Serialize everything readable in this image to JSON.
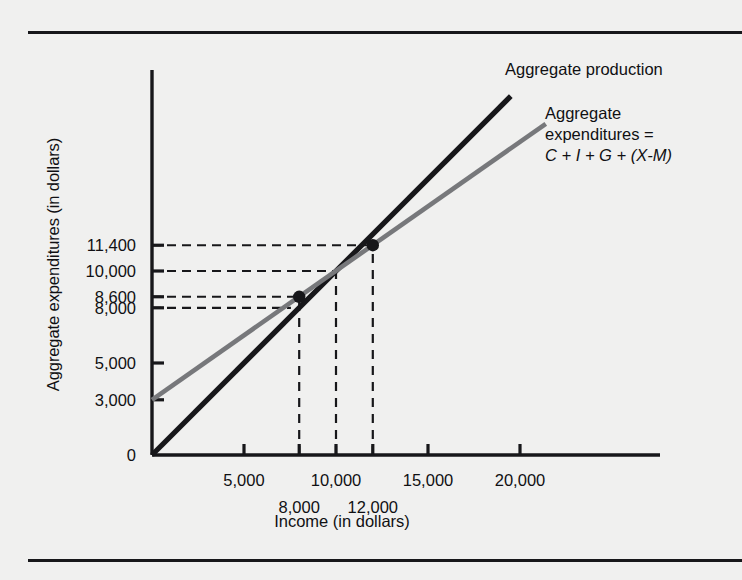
{
  "chart_data": {
    "type": "line",
    "title": "",
    "xlabel": "Income (in dollars)",
    "ylabel": "Aggregate expenditures (in dollars)",
    "xlim": [
      0,
      22500
    ],
    "ylim": [
      0,
      22500
    ],
    "grid": false,
    "legend_position": "right",
    "series": [
      {
        "name": "Aggregate production",
        "color": "#17171a",
        "intercept": 0,
        "slope": 1,
        "x": [
          0,
          19500
        ],
        "values": [
          0,
          19500
        ]
      },
      {
        "name": "Aggregate expenditures = C + I + G + (X-M)",
        "color": "#77787b",
        "intercept": 3000,
        "slope": 0.7,
        "x": [
          0,
          21400
        ],
        "values": [
          3000,
          18000
        ]
      }
    ],
    "xticks": [
      {
        "value": 5000,
        "label": "5,000",
        "row": 1
      },
      {
        "value": 8000,
        "label": "8,000",
        "row": 2
      },
      {
        "value": 10000,
        "label": "10,000",
        "row": 1
      },
      {
        "value": 12000,
        "label": "12,000",
        "row": 2
      },
      {
        "value": 15000,
        "label": "15,000",
        "row": 1
      },
      {
        "value": 20000,
        "label": "20,000",
        "row": 1
      }
    ],
    "yticks": [
      {
        "value": 0,
        "label": "0"
      },
      {
        "value": 3000,
        "label": "3,000"
      },
      {
        "value": 5000,
        "label": "5,000"
      },
      {
        "value": 8000,
        "label": "8,000"
      },
      {
        "value": 8600,
        "label": "8,600"
      },
      {
        "value": 10000,
        "label": "10,000"
      },
      {
        "value": 11400,
        "label": "11,400"
      }
    ],
    "annotations": [
      {
        "name": "point-low",
        "x": 8000,
        "y": 8600,
        "marker": "dot"
      },
      {
        "name": "point-equilibrium",
        "x": 10000,
        "y": 10000,
        "marker": "none"
      },
      {
        "name": "point-high",
        "x": 12000,
        "y": 11400,
        "marker": "dot"
      }
    ],
    "guide_lines": [
      {
        "name": "guide-11400",
        "orientation": "horizontal",
        "y": 11400,
        "x_end": 12000
      },
      {
        "name": "guide-10000",
        "orientation": "horizontal",
        "y": 10000,
        "x_end": 10000
      },
      {
        "name": "guide-8600",
        "orientation": "horizontal",
        "y": 8600,
        "x_end": 8000
      },
      {
        "name": "guide-8000",
        "orientation": "horizontal",
        "y": 8000,
        "x_end": 7550
      },
      {
        "name": "guide-8000-x",
        "orientation": "vertical",
        "x": 8000,
        "y_end": 8600
      },
      {
        "name": "guide-10000-x",
        "orientation": "vertical",
        "x": 10000,
        "y_end": 10000
      },
      {
        "name": "guide-12000-x",
        "orientation": "vertical",
        "x": 12000,
        "y_end": 11400
      }
    ]
  },
  "legend": {
    "production": {
      "label": "Aggregate production"
    },
    "expenditures": {
      "line1": "Aggregate",
      "line2": "expenditures =",
      "line3": "C + I + G + (X-M)"
    }
  },
  "axes": {
    "x_title": "Income (in dollars)",
    "y_title": "Aggregate expenditures (in dollars)"
  },
  "colors": {
    "background": "#f0f0ef",
    "ink": "#17171a",
    "gray_line": "#77787b"
  }
}
